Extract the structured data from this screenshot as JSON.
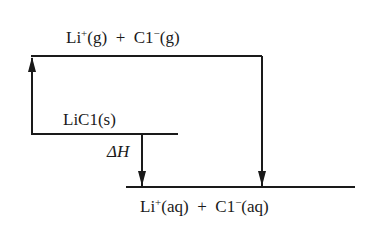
{
  "diagram": {
    "type": "energy-level diagram (Born-Haber style)",
    "colors": {
      "line": "#1a1a1a",
      "background": "#ffffff"
    },
    "levels": [
      {
        "id": "gas-ions",
        "species": [
          {
            "symbol": "Li",
            "charge": "+",
            "state": "(g)"
          },
          {
            "symbol": "C1",
            "charge": "−",
            "state": "(g)"
          }
        ],
        "operator": "+"
      },
      {
        "id": "solid",
        "label": "LiC1(s)"
      },
      {
        "id": "aqueous-ions",
        "species": [
          {
            "symbol": "Li",
            "charge": "+",
            "state": "(aq)"
          },
          {
            "symbol": "C1",
            "charge": "−",
            "state": "(aq)"
          }
        ],
        "operator": "+"
      }
    ],
    "arrows": [
      {
        "from": "solid",
        "to": "gas-ions",
        "direction": "up"
      },
      {
        "from": "gas-ions",
        "to": "aqueous-ions",
        "direction": "down"
      },
      {
        "from": "solid",
        "to": "aqueous-ions",
        "direction": "down",
        "label": "ΔH"
      }
    ],
    "text": {
      "top_li": "Li",
      "top_li_charge": "+",
      "top_li_state": "(g)",
      "top_plus": "+",
      "top_cl": "C1",
      "top_cl_charge": "−",
      "top_cl_state": "(g)",
      "solid_label": "LiC1(s)",
      "delta_h": "ΔH",
      "bottom_li": "Li",
      "bottom_li_charge": "+",
      "bottom_li_state": "(aq)",
      "bottom_plus": "+",
      "bottom_cl": "C1",
      "bottom_cl_charge": "−",
      "bottom_cl_state": "(aq)"
    }
  }
}
